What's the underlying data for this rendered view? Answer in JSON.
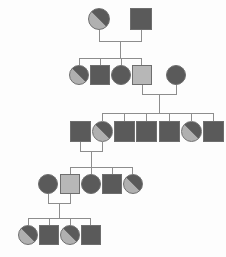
{
  "diagram": {
    "type": "pedigree-chart",
    "title": "",
    "background_color": "#fdfdfd",
    "line_color": "#8d8d8d",
    "outline_color": "#6e6e6e",
    "fill_colors": {
      "dark": "#5a5a5a",
      "light": "#b7b7b7",
      "split_dark": "#5a5a5a",
      "split_light": "#b0b0b0"
    },
    "generation_count": 5,
    "generations": [
      {
        "id": "I",
        "label": "",
        "members": [
          {
            "id": "I-1",
            "shape": "circle",
            "sex": "female",
            "fill": "split",
            "label": ""
          },
          {
            "id": "I-2",
            "shape": "square",
            "sex": "male",
            "fill": "dark",
            "label": ""
          }
        ]
      },
      {
        "id": "II",
        "label": "",
        "members": [
          {
            "id": "II-1",
            "shape": "circle",
            "sex": "female",
            "fill": "split",
            "label": ""
          },
          {
            "id": "II-2",
            "shape": "square",
            "sex": "male",
            "fill": "dark",
            "label": ""
          },
          {
            "id": "II-3",
            "shape": "circle",
            "sex": "female",
            "fill": "dark",
            "label": ""
          },
          {
            "id": "II-4",
            "shape": "square",
            "sex": "male",
            "fill": "light",
            "label": ""
          },
          {
            "id": "II-5",
            "shape": "circle",
            "sex": "female",
            "fill": "dark",
            "label": ""
          }
        ]
      },
      {
        "id": "III",
        "label": "",
        "members": [
          {
            "id": "III-1",
            "shape": "square",
            "sex": "male",
            "fill": "dark",
            "label": ""
          },
          {
            "id": "III-2",
            "shape": "circle",
            "sex": "female",
            "fill": "split",
            "label": ""
          },
          {
            "id": "III-3",
            "shape": "square",
            "sex": "male",
            "fill": "dark",
            "label": ""
          },
          {
            "id": "III-4",
            "shape": "square",
            "sex": "male",
            "fill": "dark",
            "label": ""
          },
          {
            "id": "III-5",
            "shape": "square",
            "sex": "male",
            "fill": "dark",
            "label": ""
          },
          {
            "id": "III-6",
            "shape": "circle",
            "sex": "female",
            "fill": "split",
            "label": ""
          },
          {
            "id": "III-7",
            "shape": "square",
            "sex": "male",
            "fill": "dark",
            "label": ""
          }
        ]
      },
      {
        "id": "IV",
        "label": "",
        "members": [
          {
            "id": "IV-1",
            "shape": "circle",
            "sex": "female",
            "fill": "dark",
            "label": ""
          },
          {
            "id": "IV-2",
            "shape": "square",
            "sex": "male",
            "fill": "light",
            "label": ""
          },
          {
            "id": "IV-3",
            "shape": "circle",
            "sex": "female",
            "fill": "dark",
            "label": ""
          },
          {
            "id": "IV-4",
            "shape": "square",
            "sex": "male",
            "fill": "dark",
            "label": ""
          },
          {
            "id": "IV-5",
            "shape": "circle",
            "sex": "female",
            "fill": "split",
            "label": ""
          }
        ]
      },
      {
        "id": "V",
        "label": "",
        "members": [
          {
            "id": "V-1",
            "shape": "circle",
            "sex": "female",
            "fill": "split",
            "label": ""
          },
          {
            "id": "V-2",
            "shape": "square",
            "sex": "male",
            "fill": "dark",
            "label": ""
          },
          {
            "id": "V-3",
            "shape": "circle",
            "sex": "female",
            "fill": "split",
            "label": ""
          },
          {
            "id": "V-4",
            "shape": "square",
            "sex": "male",
            "fill": "dark",
            "label": ""
          }
        ]
      }
    ],
    "unions": [
      {
        "id": "union-1",
        "partners": [
          "I-1",
          "I-2"
        ],
        "children": [
          "II-1",
          "II-2",
          "II-3",
          "II-4"
        ]
      },
      {
        "id": "union-2",
        "partners": [
          "II-4",
          "II-5"
        ],
        "children": [
          "III-2",
          "III-3",
          "III-4",
          "III-5",
          "III-6",
          "III-7"
        ]
      },
      {
        "id": "union-3",
        "partners": [
          "III-1",
          "III-2"
        ],
        "children": [
          "IV-2",
          "IV-3",
          "IV-4",
          "IV-5"
        ]
      },
      {
        "id": "union-4",
        "partners": [
          "IV-1",
          "IV-2"
        ],
        "children": [
          "V-1",
          "V-2",
          "V-3",
          "V-4"
        ]
      }
    ]
  }
}
